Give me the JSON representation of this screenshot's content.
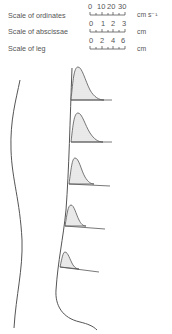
{
  "legend": {
    "rows": [
      {
        "label": "Scale of ordinates",
        "ticks": [
          "0",
          "10",
          "20",
          "30"
        ],
        "unit": "cm s⁻¹"
      },
      {
        "label": "Scale of abscissae",
        "ticks": [
          "0",
          "1",
          "2",
          "3"
        ],
        "unit": "cm"
      },
      {
        "label": "Scale of leg",
        "ticks": [
          "0",
          "2",
          "4",
          "6"
        ],
        "unit": "cm"
      }
    ]
  },
  "diagram": {
    "profile_count": 5,
    "fill_color": "#e6e6e6",
    "stroke_color": "#444444"
  }
}
